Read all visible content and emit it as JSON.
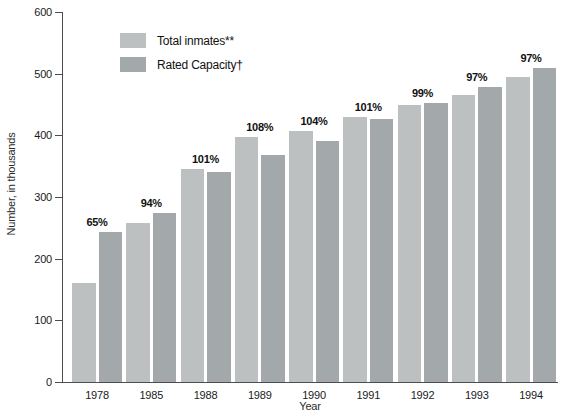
{
  "chart_data": {
    "type": "bar",
    "title": "",
    "xlabel": "Year",
    "ylabel": "Number, in thousands",
    "ylim": [
      0,
      600
    ],
    "yticks": [
      0,
      100,
      200,
      300,
      400,
      500,
      600
    ],
    "grid": false,
    "legend_position": "upper-left",
    "categories": [
      "1978",
      "1985",
      "1988",
      "1989",
      "1990",
      "1991",
      "1992",
      "1993",
      "1994"
    ],
    "series": [
      {
        "name": "Total inmates**",
        "color": "#bcc0c1",
        "values": [
          160,
          258,
          345,
          397,
          407,
          430,
          449,
          465,
          494
        ]
      },
      {
        "name": "Rated Capacity†",
        "color": "#a3a8aa",
        "values": [
          243,
          274,
          341,
          368,
          391,
          426,
          453,
          479,
          510
        ]
      }
    ],
    "bar_labels": [
      "65%",
      "94%",
      "101%",
      "108%",
      "104%",
      "101%",
      "99%",
      "97%",
      "97%"
    ]
  },
  "colors": {
    "axis": "#4d4d4d",
    "text": "#1a1a1a",
    "background": "#ffffff"
  }
}
